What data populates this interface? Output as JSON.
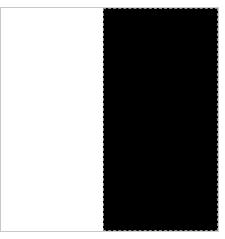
{
  "swatch": {
    "left_panel": {
      "color": "#ffffff",
      "label": ""
    },
    "right_panel": {
      "color": "#000000",
      "label": ""
    },
    "frame_border_color": "#c8c8c8",
    "selected_border_color": "#8a8a8a"
  }
}
